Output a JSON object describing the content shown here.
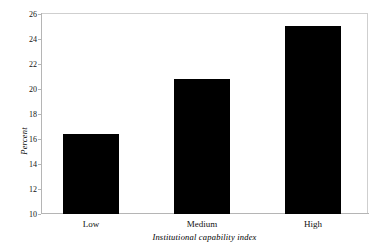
{
  "chart_data": {
    "type": "bar",
    "title": "",
    "subtitle": "",
    "categories": [
      "Low",
      "Medium",
      "High"
    ],
    "values": [
      16.4,
      20.8,
      25.0
    ],
    "xlabel": "Institutional capability index",
    "ylabel": "Percent",
    "ylim": [
      10,
      26
    ],
    "yticks": [
      10,
      12,
      14,
      16,
      18,
      20,
      22,
      24,
      26
    ],
    "ytick_labels": [
      "10",
      "12",
      "14",
      "16",
      "18",
      "20",
      "22",
      "24",
      "26"
    ],
    "grid": false,
    "legend": null,
    "bar_color": "#000000",
    "plot_background": "#ffffff",
    "frame_color": "#b5b5b5",
    "annotations": []
  },
  "axes": {
    "y_title": "Percent",
    "x_title": "Institutional capability index"
  }
}
